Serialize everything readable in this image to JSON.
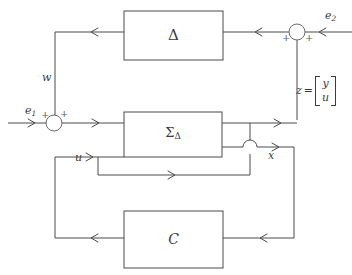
{
  "diagram": {
    "type": "control-block-diagram",
    "background_color": "#ffffff",
    "line_color": "#4a4a4a",
    "text_color": "#3c3c3c"
  },
  "blocks": [
    {
      "id": "delta",
      "label": "Δ",
      "name": "uncertainty-block",
      "x": 124,
      "y": 11,
      "width": 99,
      "height": 49
    },
    {
      "id": "sigma_delta",
      "label_main": "Σ",
      "label_sub": "Δ",
      "name": "plant-block",
      "x": 124,
      "y": 112,
      "width": 98,
      "height": 45
    },
    {
      "id": "controller",
      "label": "C",
      "name": "controller-block",
      "x": 124,
      "y": 211,
      "width": 99,
      "height": 57
    }
  ],
  "summing_junctions": [
    {
      "id": "sum_e1",
      "name": "summing-junction-e1",
      "cx": 54,
      "cy": 123,
      "r": 8,
      "signs": [
        {
          "symbol": "+",
          "position": "left",
          "x": 41,
          "y": 111
        },
        {
          "symbol": "+",
          "position": "top-right",
          "x": 60,
          "y": 110
        }
      ]
    },
    {
      "id": "sum_e2",
      "name": "summing-junction-e2",
      "cx": 297,
      "cy": 32,
      "r": 8,
      "signs": [
        {
          "symbol": "+",
          "position": "bottom-left",
          "x": 283,
          "y": 35
        },
        {
          "symbol": "+",
          "position": "bottom-right",
          "x": 306,
          "y": 35
        }
      ]
    }
  ],
  "signals": [
    {
      "id": "e1",
      "symbol": "e",
      "subscript": "1",
      "name": "input-signal-e1",
      "x": 25,
      "y": 108
    },
    {
      "id": "e2",
      "symbol": "e",
      "subscript": "2",
      "name": "input-signal-e2",
      "x": 325,
      "y": 12
    },
    {
      "id": "w",
      "symbol": "w",
      "subscript": "",
      "name": "signal-w",
      "x": 43,
      "y": 72
    },
    {
      "id": "u",
      "symbol": "u",
      "subscript": "",
      "name": "signal-u",
      "x": 75,
      "y": 152
    },
    {
      "id": "x",
      "symbol": "x",
      "subscript": "",
      "name": "signal-x",
      "x": 268,
      "y": 150
    }
  ],
  "z_label": {
    "name": "signal-z-vector",
    "symbol": "z",
    "equals": "=",
    "vector_top": "y",
    "vector_bottom": "u",
    "x": 296,
    "y": 76
  }
}
